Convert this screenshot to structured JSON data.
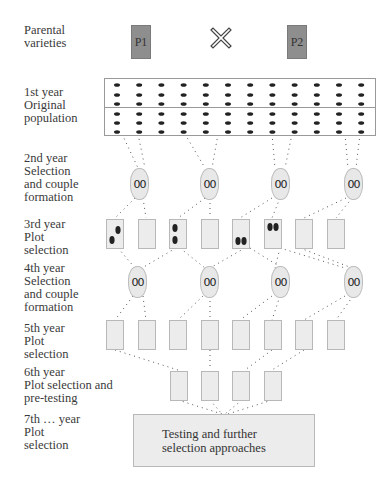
{
  "diagram": {
    "parents": [
      {
        "label": "P1"
      },
      {
        "label": "P2"
      }
    ],
    "cross_symbol": "cross-icon",
    "stages": [
      {
        "label": "Parental\nvarieties"
      },
      {
        "label": "1st year\nOriginal\npopulation"
      },
      {
        "label": "2nd year\nSelection\nand couple\nformation"
      },
      {
        "label": "3rd year\nPlot\nselection"
      },
      {
        "label": "4th year\nSelection\nand couple\nformation"
      },
      {
        "label": "5th year\nPlot\nselection"
      },
      {
        "label": "6th year\nPlot selection and\npre-testing"
      },
      {
        "label": "7th … year\nPlot\nselection"
      }
    ],
    "population": {
      "rows": 6,
      "columns": 12
    },
    "couple_symbol": "00",
    "final_box": {
      "label": "Testing and further\nselection approaches"
    },
    "colors": {
      "parent_fill": "#8e8e8e",
      "plot_fill": "#ececec",
      "oval_fill": "#e8e8e8",
      "dot": "#222222"
    }
  }
}
